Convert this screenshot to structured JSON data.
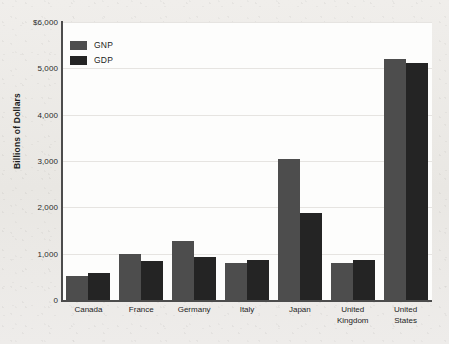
{
  "chart_data": {
    "type": "bar",
    "title": "",
    "subtitle": "",
    "xlabel": "",
    "ylabel": "Billions of Dollars",
    "ylim": [
      0,
      6000
    ],
    "ytick_values": [
      6000,
      5000,
      4000,
      3000,
      2000,
      1000,
      0
    ],
    "ytick_labels": [
      "$6,000",
      "5,000",
      "4,000",
      "3,000",
      "2,000",
      "1,000",
      "0"
    ],
    "grid": true,
    "legend_position": "top-left",
    "categories": [
      "Canada",
      "France",
      "Germany",
      "Italy",
      "Japan",
      "United Kingdom",
      "United States"
    ],
    "category_label_lines": [
      [
        "Canada"
      ],
      [
        "France"
      ],
      [
        "Germany"
      ],
      [
        "Italy"
      ],
      [
        "Japan"
      ],
      [
        "United",
        "Kingdom"
      ],
      [
        "United",
        "States"
      ]
    ],
    "series": [
      {
        "name": "GNP",
        "color": "#4d4d4d",
        "values": [
          525,
          985,
          1270,
          790,
          3050,
          800,
          5200
        ]
      },
      {
        "name": "GDP",
        "color": "#242424",
        "values": [
          590,
          840,
          920,
          855,
          1880,
          870,
          5120
        ]
      }
    ]
  },
  "legend": {
    "items": [
      {
        "label": "GNP",
        "color": "#4d4d4d"
      },
      {
        "label": "GDP",
        "color": "#242424"
      }
    ]
  },
  "colors": {
    "gnp": "#4d4d4d",
    "gdp": "#242424",
    "axis": "#4c4c4c",
    "gridline": "#e6e4e1",
    "plot_background": "#fdfdfc",
    "page_background": "#eceae7"
  }
}
